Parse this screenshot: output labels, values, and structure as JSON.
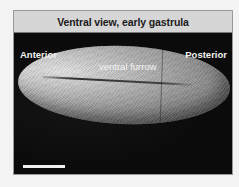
{
  "figure": {
    "title": "Ventral view, early gastrula",
    "labels": {
      "left": "Anterior",
      "right": "Posterior",
      "structure": "ventral furrow"
    },
    "scale_bar": {
      "visible": true,
      "color": "#f0f0f0"
    },
    "colors": {
      "title_background": "#d6d6d6",
      "image_background": "#0c0c0c",
      "label_text": "#f2f2f2"
    }
  }
}
